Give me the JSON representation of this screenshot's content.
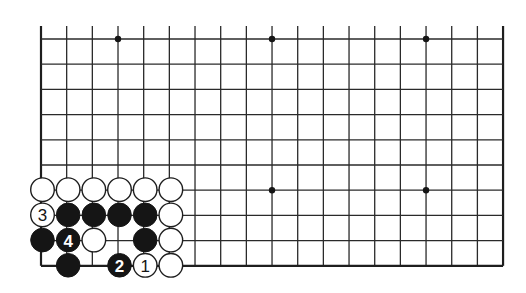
{
  "diagram": {
    "type": "go-board-partial",
    "grid": {
      "columns": 19,
      "rows": 10,
      "open_top": true,
      "origin_x": 41,
      "origin_y": 39,
      "spacing_x": 25.67,
      "spacing_y": 25.2,
      "edges": [
        "left",
        "right",
        "bottom"
      ]
    },
    "colors": {
      "line": "#2a2a2a",
      "black_stone": "#151515",
      "white_stone": "#ffffff",
      "background": "#ffffff"
    },
    "star_points": [
      {
        "col": 3,
        "row": 0
      },
      {
        "col": 9,
        "row": 0
      },
      {
        "col": 15,
        "row": 0
      },
      {
        "col": 9,
        "row": 6
      },
      {
        "col": 15,
        "row": 6
      }
    ],
    "stones": [
      {
        "col": 0,
        "row": 6,
        "color": "white",
        "label": ""
      },
      {
        "col": 1,
        "row": 6,
        "color": "white",
        "label": ""
      },
      {
        "col": 2,
        "row": 6,
        "color": "white",
        "label": ""
      },
      {
        "col": 3,
        "row": 6,
        "color": "white",
        "label": ""
      },
      {
        "col": 4,
        "row": 6,
        "color": "white",
        "label": ""
      },
      {
        "col": 5,
        "row": 6,
        "color": "white",
        "label": ""
      },
      {
        "col": 0,
        "row": 7,
        "color": "white",
        "label": "3"
      },
      {
        "col": 1,
        "row": 7,
        "color": "black",
        "label": ""
      },
      {
        "col": 2,
        "row": 7,
        "color": "black",
        "label": ""
      },
      {
        "col": 3,
        "row": 7,
        "color": "black",
        "label": ""
      },
      {
        "col": 4,
        "row": 7,
        "color": "black",
        "label": ""
      },
      {
        "col": 5,
        "row": 7,
        "color": "white",
        "label": ""
      },
      {
        "col": 0,
        "row": 8,
        "color": "black",
        "label": ""
      },
      {
        "col": 1,
        "row": 8,
        "color": "black",
        "label": "4"
      },
      {
        "col": 2,
        "row": 8,
        "color": "white",
        "label": ""
      },
      {
        "col": 4,
        "row": 8,
        "color": "black",
        "label": ""
      },
      {
        "col": 5,
        "row": 8,
        "color": "white",
        "label": ""
      },
      {
        "col": 1,
        "row": 9,
        "color": "black",
        "label": ""
      },
      {
        "col": 3,
        "row": 9,
        "color": "black",
        "label": "2"
      },
      {
        "col": 4,
        "row": 9,
        "color": "white",
        "label": "1"
      },
      {
        "col": 5,
        "row": 9,
        "color": "white",
        "label": ""
      }
    ],
    "move_sequence": [
      {
        "move": "1",
        "color": "white",
        "col": 4,
        "row": 9
      },
      {
        "move": "2",
        "color": "black",
        "col": 3,
        "row": 9
      },
      {
        "move": "3",
        "color": "white",
        "col": 0,
        "row": 7
      },
      {
        "move": "4",
        "color": "black",
        "col": 1,
        "row": 8
      }
    ]
  }
}
